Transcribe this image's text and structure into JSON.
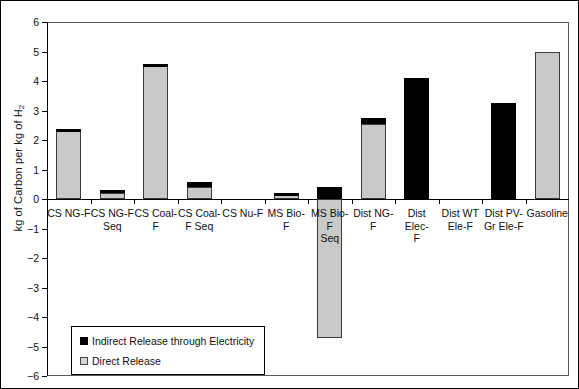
{
  "chart_data": {
    "type": "bar",
    "stacked": true,
    "title": "",
    "xlabel": "",
    "ylabel": "kg of Carbon per kg of H2",
    "ylabel_display": "kg of Carbon per kg of H",
    "ylabel_sub": "2",
    "ylim": [
      -6,
      6
    ],
    "ytick_step": 1,
    "yticks": [
      "6",
      "5",
      "4",
      "3",
      "2",
      "1",
      "0",
      "−1",
      "−2",
      "−3",
      "−4",
      "−5",
      "−6"
    ],
    "grid": false,
    "legend_position": "lower-left-inside",
    "categories": [
      "CS NG-F",
      "CS NG-F Seq",
      "CS Coal-F",
      "CS Coal-F Seq",
      "CS Nu-F",
      "MS Bio-F",
      "MS Bio-F Seq",
      "Dist NG-F",
      "Dist Elec-F",
      "Dist WT Ele-F",
      "Dist PV-Gr Ele-F",
      "Gasoline"
    ],
    "category_lines": [
      [
        "CS NG-F"
      ],
      [
        "CS NG-F",
        "Seq"
      ],
      [
        "CS Coal-",
        "F"
      ],
      [
        "CS Coal-",
        "F Seq"
      ],
      [
        "CS Nu-F"
      ],
      [
        "MS Bio-F"
      ],
      [
        "MS Bio-F",
        "Seq"
      ],
      [
        "Dist NG-F"
      ],
      [
        "Dist Elec-",
        "F"
      ],
      [
        "Dist WT",
        "Ele-F"
      ],
      [
        "Dist PV-",
        "Gr Ele-F"
      ],
      [
        "Gasoline"
      ]
    ],
    "series": [
      {
        "name": "Direct Release",
        "color": "#c9c9c9",
        "values": [
          2.3,
          0.22,
          4.5,
          0.42,
          0.0,
          0.2,
          -4.7,
          2.55,
          0.0,
          0.0,
          0.0,
          5.0
        ]
      },
      {
        "name": "Indirect Release through Electricity",
        "color": "#000000",
        "values": [
          0.08,
          0.1,
          0.07,
          0.15,
          0.0,
          0.02,
          0.4,
          0.2,
          4.1,
          0.0,
          3.25,
          0.0
        ]
      }
    ],
    "totals": [
      2.38,
      0.32,
      4.57,
      0.57,
      0.0,
      0.22,
      -4.3,
      2.75,
      4.1,
      0.0,
      3.25,
      5.0
    ],
    "annotations": []
  },
  "legend": {
    "items": [
      {
        "label": "Indirect Release through Electricity",
        "swatch": "black-square"
      },
      {
        "label": "Direct Release",
        "swatch": "gray-square"
      }
    ]
  },
  "colors": {
    "direct": "#c9c9c9",
    "indirect": "#000000",
    "axis": "#000000",
    "frame": "#5a5a5a",
    "background": "#ffffff"
  }
}
